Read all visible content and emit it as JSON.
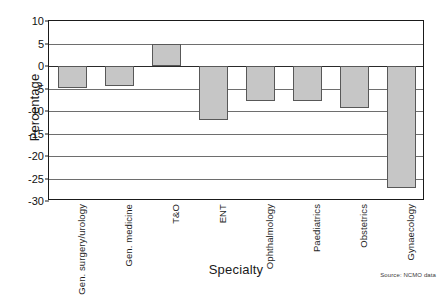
{
  "chart_data": {
    "type": "bar",
    "title": "",
    "xlabel": "Specialty",
    "ylabel": "Percentage",
    "ylim": [
      -30,
      10
    ],
    "yticks": [
      10,
      5,
      0,
      -5,
      -10,
      -15,
      -20,
      -25,
      -30
    ],
    "ytick_labels": [
      "10",
      "5",
      "0",
      "-5",
      "-10",
      "-15",
      "-20",
      "-25",
      "-30"
    ],
    "grid": true,
    "legend": "none",
    "categories": [
      "Gen. surgery/urology",
      "Gen. medicine",
      "T&O",
      "ENT",
      "Ophthalmology",
      "Paediatrics",
      "Obstetrics",
      "Gynaecology"
    ],
    "values": [
      -4.8,
      -4.5,
      4.8,
      -12.0,
      -7.7,
      -7.7,
      -9.3,
      -27.2
    ],
    "bar_color": "#c6c6c6",
    "bar_edge_color": "#585858",
    "annotations": [
      "Source: NCMO data"
    ]
  },
  "source_note": "Source: NCMO data"
}
